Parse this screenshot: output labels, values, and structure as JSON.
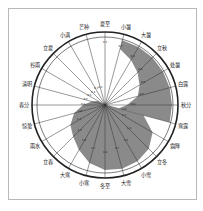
{
  "diagram": {
    "title": "",
    "center": [
      105,
      105
    ],
    "outer_radius": 73,
    "inner_ring_radius": 68,
    "colors": {
      "fill": "#8a8a8a",
      "spoke": "#333333",
      "ring": "#222222",
      "frame": "#b8b8b8"
    },
    "solar_terms": [
      {
        "name": "夏至",
        "value": "0.2"
      },
      {
        "name": "小暑",
        "value": "0.2"
      },
      {
        "name": "大暑",
        "value": "0.3"
      },
      {
        "name": "立秋",
        "value": "0.4"
      },
      {
        "name": "处暑",
        "value": "0.5"
      },
      {
        "name": "白露",
        "value": "0.7"
      },
      {
        "name": "秋分",
        "value": "0.8"
      },
      {
        "name": "寒露",
        "value": "1.0"
      },
      {
        "name": "霜降",
        "value": "1.2"
      },
      {
        "name": "立冬",
        "value": "1.4"
      },
      {
        "name": "小雪",
        "value": "1.6"
      },
      {
        "name": "大雪",
        "value": "1.7"
      },
      {
        "name": "冬至",
        "value": "1.8"
      },
      {
        "name": "小寒",
        "value": "1.7"
      },
      {
        "name": "大寒",
        "value": "1.6"
      },
      {
        "name": "立春",
        "value": "1.4"
      },
      {
        "name": "雨水",
        "value": "1.2"
      },
      {
        "name": "惊蛰",
        "value": "1.0"
      },
      {
        "name": "春分",
        "value": "0.8"
      },
      {
        "name": "清明",
        "value": "0.7"
      },
      {
        "name": "谷雨",
        "value": "0.5"
      },
      {
        "name": "立夏",
        "value": "0.4"
      },
      {
        "name": "小满",
        "value": "0.3"
      },
      {
        "name": "芒种",
        "value": "0.2"
      }
    ]
  }
}
